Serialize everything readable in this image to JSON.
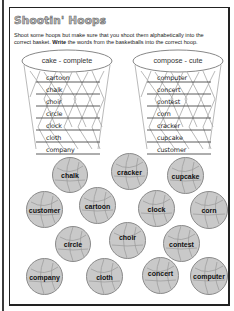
{
  "worksheet": {
    "title": "Shootin' Hoops",
    "instructions_line1": "Shoot some hoops but make sure that you shoot them alphabetically into the",
    "instructions_line2_pre": "correct basket. ",
    "instructions_line2_bold": "Write",
    "instructions_line2_post": " the words from the basketballs into the correct hoop."
  },
  "hoops": [
    {
      "label": "cake - complete",
      "words": [
        "cartoon",
        "chalk",
        "choir",
        "circle",
        "clock",
        "cloth",
        "company"
      ]
    },
    {
      "label": "compose - cute",
      "words": [
        "computer",
        "concert",
        "contest",
        "corn",
        "cracker",
        "cupcake",
        "customer"
      ]
    }
  ],
  "basketballs": [
    {
      "label": "chalk"
    },
    {
      "label": "cracker"
    },
    {
      "label": "cupcake"
    },
    {
      "label": "customer"
    },
    {
      "label": "cartoon"
    },
    {
      "label": "clock"
    },
    {
      "label": "corn"
    },
    {
      "label": "circle"
    },
    {
      "label": "choir"
    },
    {
      "label": "contest"
    },
    {
      "label": "company"
    },
    {
      "label": "cloth"
    },
    {
      "label": "concert"
    },
    {
      "label": "computer"
    }
  ],
  "colors": {
    "ball_fill": "#c9c9c9",
    "ball_stroke": "#8a8a8a",
    "title_fill": "#bdbdbd",
    "net_line": "#9a9a9a"
  }
}
